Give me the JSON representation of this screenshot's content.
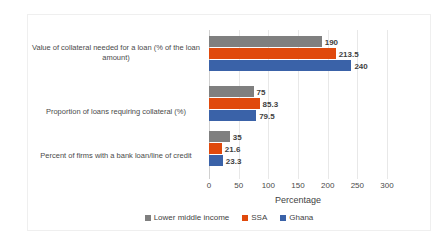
{
  "chart_data": {
    "type": "bar",
    "orientation": "horizontal",
    "title": "",
    "xlabel": "Percentage",
    "ylabel": "",
    "xlim": [
      0,
      300
    ],
    "xticks": [
      0,
      50,
      100,
      150,
      200,
      250,
      300
    ],
    "grid": true,
    "legend_position": "bottom",
    "categories": [
      "Value of collateral needed for a loan (% of the loan amount)",
      "Proportion of loans requiring collateral (%)",
      "Percent of firms with a bank loan/line of credit"
    ],
    "series": [
      {
        "name": "Lower middle income",
        "color": "#7f7f7f",
        "values": [
          190,
          75,
          35
        ],
        "labels": [
          "190",
          "75",
          "35"
        ]
      },
      {
        "name": "SSA",
        "color": "#e0490c",
        "values": [
          213.5,
          85.3,
          21.6
        ],
        "labels": [
          "213.5",
          "85.3",
          "21.6"
        ]
      },
      {
        "name": "Ghana",
        "color": "#3a62a8",
        "values": [
          240,
          79.5,
          23.3
        ],
        "labels": [
          "240",
          "79.5",
          "23.3"
        ]
      }
    ]
  },
  "axis": {
    "x_title": "Percentage",
    "tick_labels": [
      "0",
      "50",
      "100",
      "150",
      "200",
      "250",
      "300"
    ]
  },
  "legend": {
    "items": [
      {
        "label": "Lower middle income",
        "color": "#7f7f7f"
      },
      {
        "label": "SSA",
        "color": "#e0490c"
      },
      {
        "label": "Ghana",
        "color": "#3a62a8"
      }
    ]
  },
  "caption": {
    "text": ""
  }
}
